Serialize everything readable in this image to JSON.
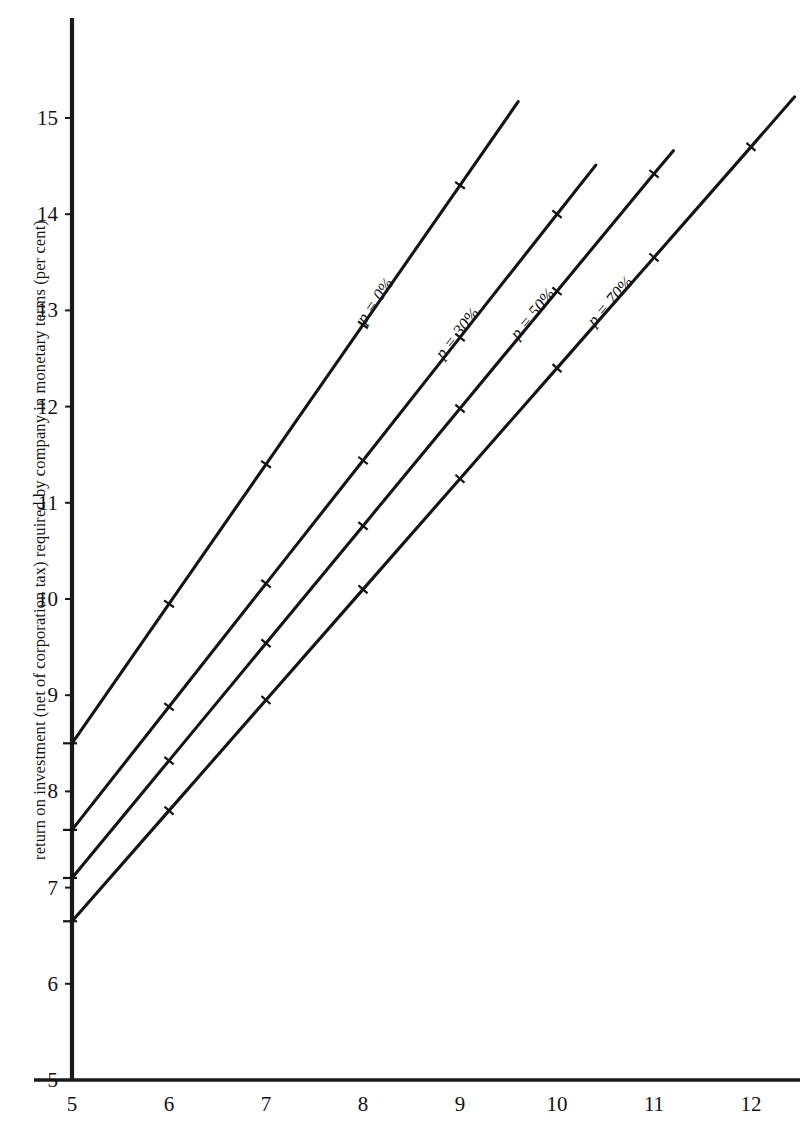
{
  "chart_data": {
    "type": "line",
    "title": "",
    "subtitle": "",
    "xlabel": "",
    "ylabel": "return on investment (net of corporation tax) required by company in monetary terms (per cent)",
    "xlim": [
      5,
      12.5
    ],
    "ylim": [
      5,
      15.8
    ],
    "xticks": [
      5,
      6,
      7,
      8,
      9,
      10,
      11,
      12
    ],
    "yticks": [
      5,
      6,
      7,
      8,
      9,
      10,
      11,
      12,
      13,
      14,
      15
    ],
    "xtick_labels": [
      "5",
      "6",
      "7",
      "8",
      "9",
      "10",
      "11",
      "12"
    ],
    "ytick_labels": [
      "5",
      "6",
      "7",
      "8",
      "9",
      "10",
      "11",
      "12",
      "13",
      "14",
      "15"
    ],
    "grid": false,
    "legend": "inline-labels-along-lines",
    "markers": "small-tick-hash-at-integer-x",
    "series": [
      {
        "name": "p = 0%",
        "label_prefix": "p = ",
        "label_value": "0",
        "label_suffix": "%",
        "intercept_at_x5": 8.5,
        "slope": 1.45,
        "x": [
          5,
          6,
          7,
          8,
          9,
          9.6
        ],
        "y": [
          8.5,
          9.95,
          11.4,
          12.85,
          14.3,
          15.17
        ]
      },
      {
        "name": "p = 30%",
        "label_prefix": "p = ",
        "label_value": "30",
        "label_suffix": "%",
        "intercept_at_x5": 7.6,
        "slope": 1.28,
        "x": [
          5,
          6,
          7,
          8,
          9,
          10,
          10.4
        ],
        "y": [
          7.6,
          8.88,
          10.16,
          11.44,
          12.72,
          14.0,
          14.51
        ]
      },
      {
        "name": "p = 50%",
        "label_prefix": "p = ",
        "label_value": "50",
        "label_suffix": "%",
        "intercept_at_x5": 7.1,
        "slope": 1.22,
        "x": [
          5,
          6,
          7,
          8,
          9,
          10,
          11,
          11.2
        ],
        "y": [
          7.1,
          8.32,
          9.54,
          10.76,
          11.98,
          13.2,
          14.42,
          14.66
        ]
      },
      {
        "name": "p = 70%",
        "label_prefix": "p = ",
        "label_value": "70",
        "label_suffix": "%",
        "intercept_at_x5": 6.65,
        "slope": 1.15,
        "x": [
          5,
          6,
          7,
          8,
          9,
          10,
          11,
          12,
          12.45
        ],
        "y": [
          6.65,
          7.8,
          8.95,
          10.1,
          11.25,
          12.4,
          13.55,
          14.7,
          15.22
        ]
      }
    ]
  },
  "axis": {
    "y_title": "return on investment (net of corporation tax) required by company in monetary terms (per cent)"
  },
  "series_labels": {
    "s0": "p = 0%",
    "s1": "p = 30%",
    "s2": "p = 50%",
    "s3": "p = 70%"
  },
  "colors": {
    "line": "#141414",
    "axis": "#1a1a1a",
    "text": "#121212",
    "background": "#ffffff"
  }
}
